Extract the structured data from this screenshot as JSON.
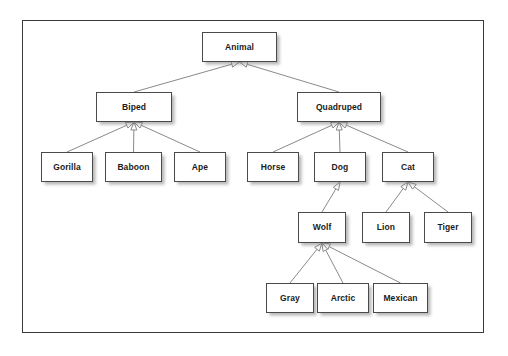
{
  "diagram": {
    "type": "uml-generalization-tree",
    "frame": {
      "stroke": "#3a3a3a",
      "fill": "#ffffff"
    },
    "node_style": {
      "fill": "#ffffff",
      "stroke": "#4a4a4a",
      "text": "#1b1b1b"
    },
    "edge_style": {
      "stroke": "#8a8a8a",
      "arrow": "hollow-triangle",
      "direction": "child-to-parent"
    },
    "nodes": [
      {
        "id": "animal",
        "label": "Animal",
        "x": 202,
        "y": 32,
        "w": 75,
        "h": 30,
        "level": 0
      },
      {
        "id": "biped",
        "label": "Biped",
        "x": 96,
        "y": 92,
        "w": 76,
        "h": 30,
        "level": 1
      },
      {
        "id": "quadruped",
        "label": "Quadruped",
        "x": 297,
        "y": 92,
        "w": 84,
        "h": 30,
        "level": 1
      },
      {
        "id": "gorilla",
        "label": "Gorilla",
        "x": 41,
        "y": 152,
        "w": 52,
        "h": 30,
        "level": 2
      },
      {
        "id": "baboon",
        "label": "Baboon",
        "x": 105,
        "y": 152,
        "w": 57,
        "h": 30,
        "level": 2
      },
      {
        "id": "ape",
        "label": "Ape",
        "x": 174,
        "y": 152,
        "w": 52,
        "h": 30,
        "level": 2
      },
      {
        "id": "horse",
        "label": "Horse",
        "x": 247,
        "y": 152,
        "w": 52,
        "h": 30,
        "level": 2
      },
      {
        "id": "dog",
        "label": "Dog",
        "x": 314,
        "y": 152,
        "w": 52,
        "h": 30,
        "level": 2
      },
      {
        "id": "cat",
        "label": "Cat",
        "x": 382,
        "y": 152,
        "w": 52,
        "h": 30,
        "level": 2
      },
      {
        "id": "wolf",
        "label": "Wolf",
        "x": 298,
        "y": 212,
        "w": 48,
        "h": 31,
        "level": 3
      },
      {
        "id": "lion",
        "label": "Lion",
        "x": 362,
        "y": 212,
        "w": 48,
        "h": 31,
        "level": 3
      },
      {
        "id": "tiger",
        "label": "Tiger",
        "x": 424,
        "y": 212,
        "w": 48,
        "h": 31,
        "level": 3
      },
      {
        "id": "gray",
        "label": "Gray",
        "x": 266,
        "y": 283,
        "w": 48,
        "h": 30,
        "level": 4
      },
      {
        "id": "arctic",
        "label": "Arctic",
        "x": 317,
        "y": 283,
        "w": 52,
        "h": 30,
        "level": 4
      },
      {
        "id": "mexican",
        "label": "Mexican",
        "x": 373,
        "y": 283,
        "w": 55,
        "h": 30,
        "level": 4
      }
    ],
    "edges": [
      {
        "from": "biped",
        "to": "animal"
      },
      {
        "from": "quadruped",
        "to": "animal"
      },
      {
        "from": "gorilla",
        "to": "biped"
      },
      {
        "from": "baboon",
        "to": "biped"
      },
      {
        "from": "ape",
        "to": "biped"
      },
      {
        "from": "horse",
        "to": "quadruped"
      },
      {
        "from": "dog",
        "to": "quadruped"
      },
      {
        "from": "cat",
        "to": "quadruped"
      },
      {
        "from": "wolf",
        "to": "dog"
      },
      {
        "from": "lion",
        "to": "cat"
      },
      {
        "from": "tiger",
        "to": "cat"
      },
      {
        "from": "gray",
        "to": "wolf"
      },
      {
        "from": "arctic",
        "to": "wolf"
      },
      {
        "from": "mexican",
        "to": "wolf"
      }
    ]
  }
}
